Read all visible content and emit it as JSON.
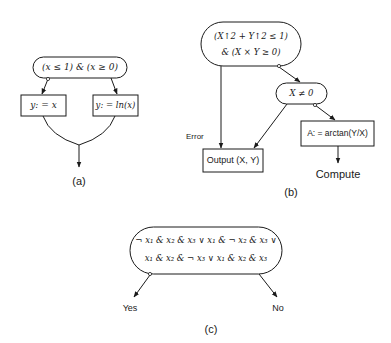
{
  "diagram_a": {
    "condition": "(x ≤ 1) & (x ≥ 0)",
    "left_box": "y: = x",
    "right_box": "y: = ln(x)",
    "caption": "(a)"
  },
  "diagram_b": {
    "condition_line1": "(X↑2 + Y↑2 ≤ 1)",
    "condition_line2": "& (X × Y ≥ 0)",
    "inner_condition": "X ≠ 0",
    "error_label": "Error",
    "output_box": "Output (X, Y)",
    "assign_box": "A: = arctan(Y/X)",
    "compute_label": "Compute",
    "caption": "(b)"
  },
  "diagram_c": {
    "condition_line1": "¬ x₁ & x₂ & x₃ ∨ x₁ & ¬ x₂ & x₃ ∨",
    "condition_line2": "x₁ & x₂ & ¬ x₃ ∨ x₁ & x₂ & x₃",
    "yes_label": "Yes",
    "no_label": "No",
    "caption": "(c)"
  },
  "colors": {
    "stroke": "#1a1a1a",
    "background": "#ffffff"
  }
}
